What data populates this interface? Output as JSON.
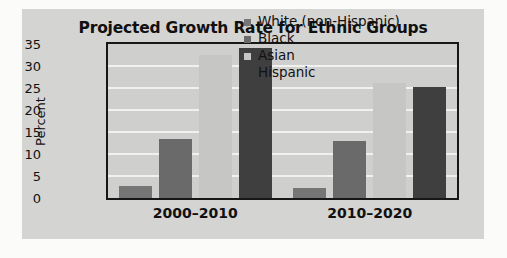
{
  "chart_data": {
    "type": "bar",
    "title": "Projected Growth Rate for Ethnic Groups",
    "xlabel": "",
    "ylabel": "Percent",
    "categories": [
      "2000–2010",
      "2010–2020"
    ],
    "yticks": [
      "35",
      "30",
      "25",
      "20",
      "15",
      "10",
      "5",
      "0"
    ],
    "ylim": [
      0,
      35
    ],
    "grid": true,
    "legend_position": "top-right inside plot",
    "series": [
      {
        "name": "White (non-Hispanic)",
        "color": "#767676",
        "values": [
          2.8,
          2.3
        ]
      },
      {
        "name": "Black",
        "color": "#6a6a6a",
        "values": [
          13.5,
          13.0
        ]
      },
      {
        "name": "Asian",
        "color": "#c6c6c4",
        "values": [
          32.5,
          26.2
        ]
      },
      {
        "name": "Hispanic",
        "color": "#3f3f3f",
        "values": [
          34.0,
          25.2
        ]
      }
    ]
  },
  "legend": {
    "items": [
      {
        "label": "White (non-Hispanic)",
        "color": "#767676"
      },
      {
        "label": "Black",
        "color": "#6a6a6a"
      },
      {
        "label": "Asian",
        "color": "#c6c6c4"
      },
      {
        "label": "Hispanic",
        "color": "#3f3f3f"
      }
    ]
  },
  "colors": {
    "page_background": "#fbfbf9",
    "card_background": "#d4d4d2",
    "plot_background": "#cfcfcd",
    "axis_border": "#171717",
    "gridline": "#f1f1ef",
    "text": "#111111"
  }
}
